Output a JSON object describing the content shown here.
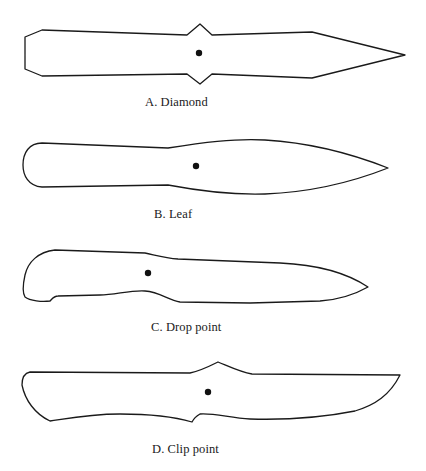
{
  "figure": {
    "knives": [
      {
        "id": "A",
        "label": "A. Diamond",
        "shape": "diamond"
      },
      {
        "id": "B",
        "label": "B. Leaf",
        "shape": "leaf"
      },
      {
        "id": "C",
        "label": "C. Drop point",
        "shape": "drop-point"
      },
      {
        "id": "D",
        "label": "D. Clip point",
        "shape": "clip-point"
      }
    ],
    "colors": {
      "outline": "#1a1a1a",
      "fill": "#ffffff",
      "balance_hole": "#111111",
      "background": "#ffffff"
    }
  }
}
